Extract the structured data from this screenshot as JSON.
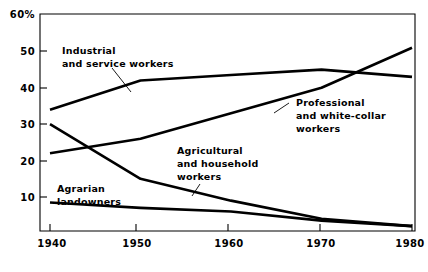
{
  "chart_data": {
    "type": "line",
    "title": "",
    "subtitle": "",
    "xlabel": "",
    "ylabel": "",
    "grid": false,
    "legend_position": "inline-annotations",
    "x": [
      1940,
      1950,
      1960,
      1970,
      1980
    ],
    "xlim": [
      1938,
      1982
    ],
    "ylim": [
      0,
      60
    ],
    "y_unit": "%",
    "x_tick_labels": [
      "1940",
      "1950",
      "1960",
      "1970",
      "1980"
    ],
    "y_tick_labels": [
      "60%",
      "50",
      "40",
      "30",
      "20",
      "10"
    ],
    "y_ticks": [
      60,
      50,
      40,
      30,
      20,
      10
    ],
    "series": [
      {
        "name": "Industrial and service workers",
        "label_line1": "Industrial",
        "label_line2": "and service workers",
        "label_line3": "",
        "values": [
          34,
          42,
          43.5,
          45,
          43
        ]
      },
      {
        "name": "Professional and white-collar workers",
        "label_line1": "Professional",
        "label_line2": "and white-collar",
        "label_line3": "workers",
        "values": [
          22,
          26,
          33,
          40,
          51
        ]
      },
      {
        "name": "Agricultural and household workers",
        "label_line1": "Agricultural",
        "label_line2": "and household",
        "label_line3": "workers",
        "values": [
          30,
          15,
          9,
          4,
          2
        ]
      },
      {
        "name": "Agrarian landowners",
        "label_line1": "Agrarian",
        "label_line2": "landowners",
        "label_line3": "",
        "values": [
          8.5,
          7,
          6,
          3.5,
          2
        ]
      }
    ],
    "colors": {
      "line": "#000000",
      "axis": "#000000",
      "background": "#ffffff",
      "text": "#000000"
    }
  }
}
